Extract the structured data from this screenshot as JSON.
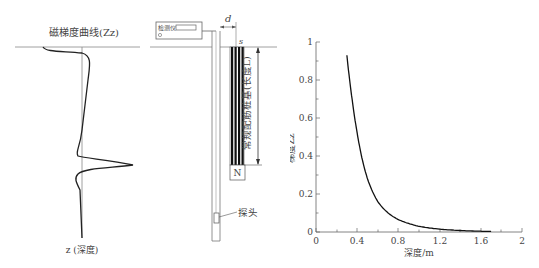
{
  "left_panel": {
    "title": "磁梯度曲线(Zz)",
    "axis_label": "z (深度)"
  },
  "middle_panel": {
    "instrument_label": "检测仪",
    "spacing_label": "d",
    "top_label": "s",
    "bottom_label": "N",
    "pile_label": "常规配筋桩基(长度L)",
    "probe_label": "探头"
  },
  "chart_data": {
    "type": "line",
    "title": "",
    "xlabel": "深度/m",
    "ylabel": "梯度Zz",
    "xlim": [
      0,
      2
    ],
    "ylim": [
      0,
      1
    ],
    "x_ticks": [
      "0",
      "0.4",
      "0.8",
      "1.2",
      "1.6",
      "2"
    ],
    "y_ticks": [
      "0",
      "0.2",
      "0.4",
      "0.6",
      "0.8",
      "1"
    ],
    "grid": false,
    "legend": null,
    "series": [
      {
        "name": "gradient",
        "x": [
          0.3,
          0.35,
          0.4,
          0.45,
          0.5,
          0.6,
          0.7,
          0.8,
          0.9,
          1.0,
          1.2,
          1.4,
          1.6,
          1.7
        ],
        "y": [
          0.93,
          0.7,
          0.52,
          0.38,
          0.28,
          0.16,
          0.1,
          0.065,
          0.045,
          0.03,
          0.015,
          0.008,
          0.004,
          0.003
        ]
      }
    ]
  }
}
